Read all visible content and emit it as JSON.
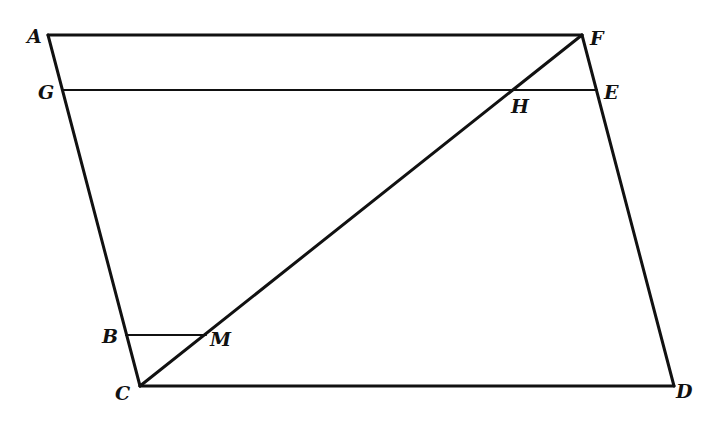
{
  "diagram": {
    "title": "",
    "points": {
      "A": {
        "x": 48,
        "y": 35,
        "label": "A",
        "lx": 27,
        "ly": 43
      },
      "F": {
        "x": 582,
        "y": 35,
        "label": "F",
        "lx": 590,
        "ly": 45
      },
      "G": {
        "x": 63,
        "y": 90,
        "label": "G",
        "lx": 38,
        "ly": 99
      },
      "E": {
        "x": 597,
        "y": 90,
        "label": "E",
        "lx": 604,
        "ly": 99
      },
      "H": {
        "x": 512,
        "y": 90,
        "label": "H",
        "lx": 512,
        "ly": 113
      },
      "B": {
        "x": 126,
        "y": 335,
        "label": "B",
        "lx": 102,
        "ly": 343
      },
      "M": {
        "x": 206,
        "y": 335,
        "label": "M",
        "lx": 210,
        "ly": 346
      },
      "C": {
        "x": 140,
        "y": 386,
        "label": "C",
        "lx": 115,
        "ly": 400
      },
      "D": {
        "x": 674,
        "y": 386,
        "label": "D",
        "lx": 676,
        "ly": 398
      }
    },
    "segments": [
      [
        "A",
        "F"
      ],
      [
        "A",
        "C"
      ],
      [
        "F",
        "D"
      ],
      [
        "C",
        "D"
      ],
      [
        "G",
        "E"
      ],
      [
        "C",
        "F"
      ],
      [
        "B",
        "M"
      ]
    ],
    "labels": {
      "A": "A",
      "B": "B",
      "C": "C",
      "D": "D",
      "E": "E",
      "F": "F",
      "G": "G",
      "H": "H",
      "M": "M"
    }
  }
}
